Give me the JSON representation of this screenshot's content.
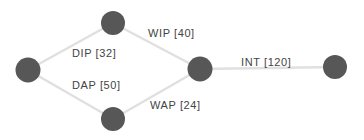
{
  "diagram": {
    "type": "network-graph",
    "colors": {
      "node": "#575757",
      "edge": "#e0e0e0",
      "label": "#444444",
      "background": "#ffffff"
    },
    "nodes": [
      {
        "id": "start",
        "cx": 28,
        "cy": 70,
        "r": 12.5
      },
      {
        "id": "top",
        "cx": 113,
        "cy": 23,
        "r": 12
      },
      {
        "id": "bottom",
        "cx": 113,
        "cy": 119,
        "r": 12
      },
      {
        "id": "merge",
        "cx": 200,
        "cy": 69,
        "r": 12.5
      },
      {
        "id": "end",
        "cx": 335,
        "cy": 67,
        "r": 12
      }
    ],
    "edges": [
      {
        "from": "start",
        "to": "top",
        "label": "DIP [32]",
        "lx": 72,
        "ly": 57
      },
      {
        "from": "start",
        "to": "bottom",
        "label": "DAP [50]",
        "lx": 72,
        "ly": 89
      },
      {
        "from": "top",
        "to": "merge",
        "label": "WIP [40]",
        "lx": 148,
        "ly": 37
      },
      {
        "from": "bottom",
        "to": "merge",
        "label": "WAP [24]",
        "lx": 150,
        "ly": 109
      },
      {
        "from": "merge",
        "to": "end",
        "label": "INT [120]",
        "lx": 241,
        "ly": 66
      }
    ]
  }
}
